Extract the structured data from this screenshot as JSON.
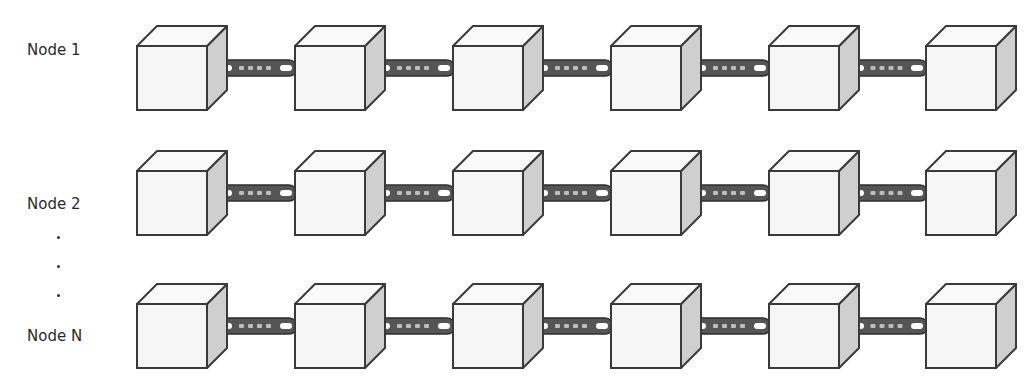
{
  "diagram": {
    "type": "replicated-blockchain",
    "rows": [
      {
        "label": "Node 1",
        "blocks": 6
      },
      {
        "label": "Node 2",
        "blocks": 6
      },
      {
        "label": "Node N",
        "blocks": 6
      }
    ],
    "ellipsis": ".\n.\n.",
    "colors": {
      "outline": "#3a3a3a",
      "front_face": "#f6f6f6",
      "top_face": "#f9f9f9",
      "side_face": "#cfcfcf",
      "chain": "#555555"
    }
  }
}
